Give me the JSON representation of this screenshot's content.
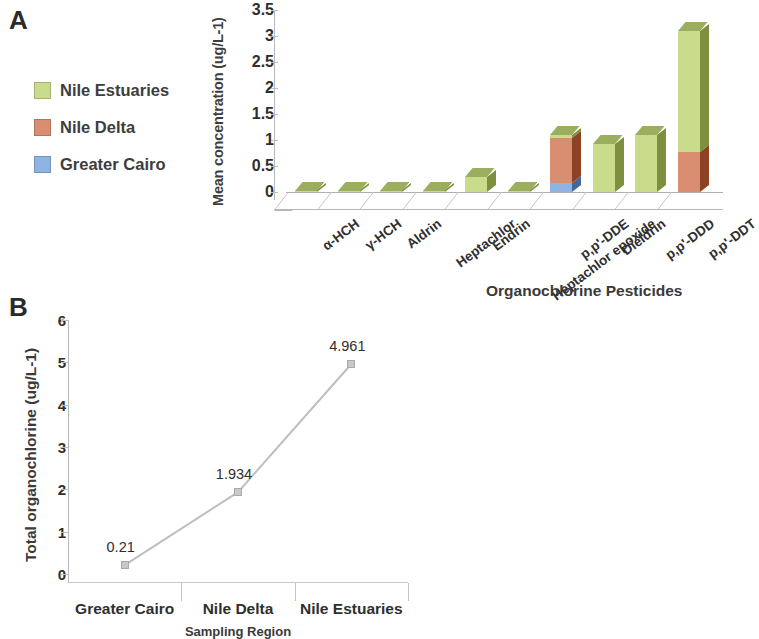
{
  "panels": {
    "a_letter": "A",
    "b_letter": "B"
  },
  "legend": {
    "items": [
      {
        "label": "Nile Estuaries",
        "color": "#C8DC8C",
        "icon": "legend-swatch-green"
      },
      {
        "label": "Nile Delta",
        "color": "#D98E72",
        "icon": "legend-swatch-red"
      },
      {
        "label": "Greater Cairo",
        "color": "#8DB4E2",
        "icon": "legend-swatch-blue"
      }
    ]
  },
  "chart_data": [
    {
      "type": "bar",
      "id": "panel-a",
      "title": "",
      "subtype": "stacked-3d-column",
      "xlabel": "Organochlorine  Pesticides",
      "ylabel": "Mean concentration (ug/L-1)",
      "ylim": [
        0,
        3.5
      ],
      "yticks": [
        "0",
        "0.5",
        "1",
        "1.5",
        "2",
        "2.5",
        "3",
        "3.5"
      ],
      "ytick_values": [
        0,
        0.5,
        1,
        1.5,
        2,
        2.5,
        3,
        3.5
      ],
      "grid": false,
      "legend_position": "left-outside",
      "categories": [
        "α-HCH",
        "γ-HCH",
        "Aldrin",
        "Heptachlor",
        "Endrin",
        "Heptachlor epoxide",
        "p,p'-DDE",
        "Dieldrin",
        "p,p'-DDD",
        "p,p'-DDT"
      ],
      "series": [
        {
          "name": "Greater Cairo",
          "color": "#8DB4E2",
          "values": [
            0,
            0,
            0,
            0,
            0,
            0,
            0.17,
            0,
            0,
            0
          ]
        },
        {
          "name": "Nile Delta",
          "color": "#D98E72",
          "values": [
            0,
            0,
            0,
            0,
            0,
            0,
            0.87,
            0,
            0,
            0.77
          ]
        },
        {
          "name": "Nile Estuaries",
          "color": "#C8DC8C",
          "values": [
            0.01,
            0.01,
            0.01,
            0.01,
            0.28,
            0.01,
            0.06,
            0.93,
            1.09,
            2.33
          ]
        }
      ]
    },
    {
      "type": "line",
      "id": "panel-b",
      "title": "",
      "xlabel": "Sampling Region",
      "ylabel": "Total organochlorine (ug/L-1)",
      "ylim": [
        0,
        6
      ],
      "yticks": [
        "0",
        "1",
        "2",
        "3",
        "4",
        "5",
        "6"
      ],
      "ytick_values": [
        0,
        1,
        2,
        3,
        4,
        5,
        6
      ],
      "grid": false,
      "legend_position": "none",
      "marker": "square",
      "line_color": "#BEBEBE",
      "marker_color": "#C9C9C9",
      "categories": [
        "Greater Cairo",
        "Nile Delta",
        "Nile Estuaries"
      ],
      "values": [
        0.21,
        1.934,
        4.961
      ],
      "data_labels": [
        "0.21",
        "1.934",
        "4.961"
      ]
    }
  ]
}
